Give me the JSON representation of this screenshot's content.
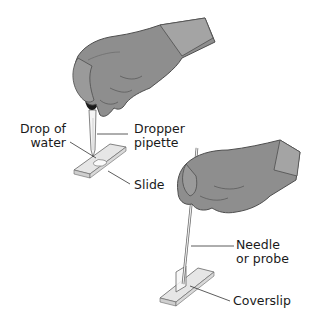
{
  "diagram": {
    "title": "",
    "colors": {
      "glove": "#8a8a8a",
      "glove_dark": "#5e5e5e",
      "glove_light": "#b3b3b3",
      "slide": "#f2f2f2",
      "outline": "#555555",
      "text": "#1a1a1a",
      "leader": "#333333"
    },
    "labels": {
      "drop_of_water_line1": "Drop of",
      "drop_of_water_line2": "water",
      "dropper_pipette_line1": "Dropper",
      "dropper_pipette_line2": "pipette",
      "slide": "Slide",
      "needle_line1": "Needle",
      "needle_line2": "or probe",
      "coverslip": "Coverslip"
    }
  }
}
